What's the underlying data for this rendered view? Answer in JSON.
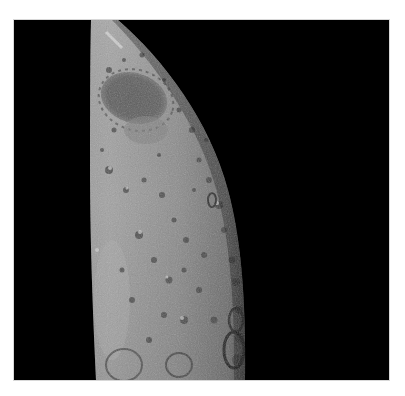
{
  "image": {
    "subject": "Lunar surface crescent with cratered terrain",
    "alt": "Grayscale photograph of a portion of the Moon's surface showing a large dark-floored crater near the top and many smaller craters along the terminator against black space",
    "colors": {
      "page_background": "#ffffff",
      "space": "#000000",
      "surface_light": "#a4a4a4",
      "surface_mid": "#8a8a8a",
      "surface_dark": "#6a6a6a",
      "mare_floor": "#585858",
      "crater_shadow": "#2a2a2a",
      "highlight": "#d0d0d0"
    }
  }
}
